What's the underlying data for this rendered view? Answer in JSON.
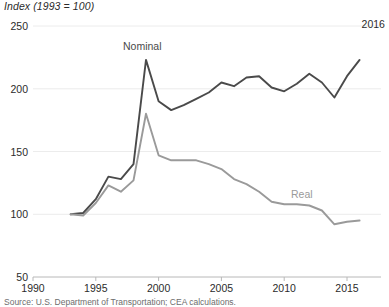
{
  "chart_data": {
    "type": "line",
    "title": "",
    "ylabel": "Index (1993 = 100)",
    "xlabel": "",
    "ylim": [
      50,
      250
    ],
    "xlim": [
      1990,
      2017
    ],
    "yticks": [
      "50",
      "100",
      "150",
      "200",
      "250"
    ],
    "ytick_values": [
      50,
      100,
      150,
      200,
      250
    ],
    "xticks": [
      "1990",
      "1995",
      "2000",
      "2005",
      "2010",
      "2015"
    ],
    "xtick_values": [
      1990,
      1995,
      2000,
      2005,
      2010,
      2015
    ],
    "grid": true,
    "legend_position": "inline-labels",
    "end_annotation": "2016",
    "x": [
      1993,
      1994,
      1995,
      1996,
      1997,
      1998,
      1999,
      2000,
      2001,
      2002,
      2003,
      2004,
      2005,
      2006,
      2007,
      2008,
      2009,
      2010,
      2011,
      2012,
      2013,
      2014,
      2015,
      2016
    ],
    "series": [
      {
        "name": "Nominal",
        "color": "#4a4a4a",
        "values": [
          100,
          101,
          112,
          130,
          128,
          140,
          223,
          190,
          183,
          187,
          192,
          197,
          205,
          202,
          209,
          210,
          201,
          198,
          204,
          212,
          205,
          193,
          210,
          223
        ]
      },
      {
        "name": "Real",
        "color": "#9a9a9a",
        "values": [
          100,
          99,
          109,
          123,
          118,
          127,
          180,
          147,
          143,
          143,
          143,
          140,
          136,
          128,
          124,
          118,
          110,
          108,
          108,
          107,
          103,
          92,
          94,
          95
        ]
      }
    ],
    "annotations": [
      {
        "text": "Nominal",
        "x": 1998.7,
        "y": 238,
        "color": "#4a4a4a"
      },
      {
        "text": "Real",
        "x": 2011.4,
        "y": 120,
        "color": "#9a9a9a"
      }
    ],
    "source": "Source: U.S. Department of Transportation; CEA calculations."
  }
}
